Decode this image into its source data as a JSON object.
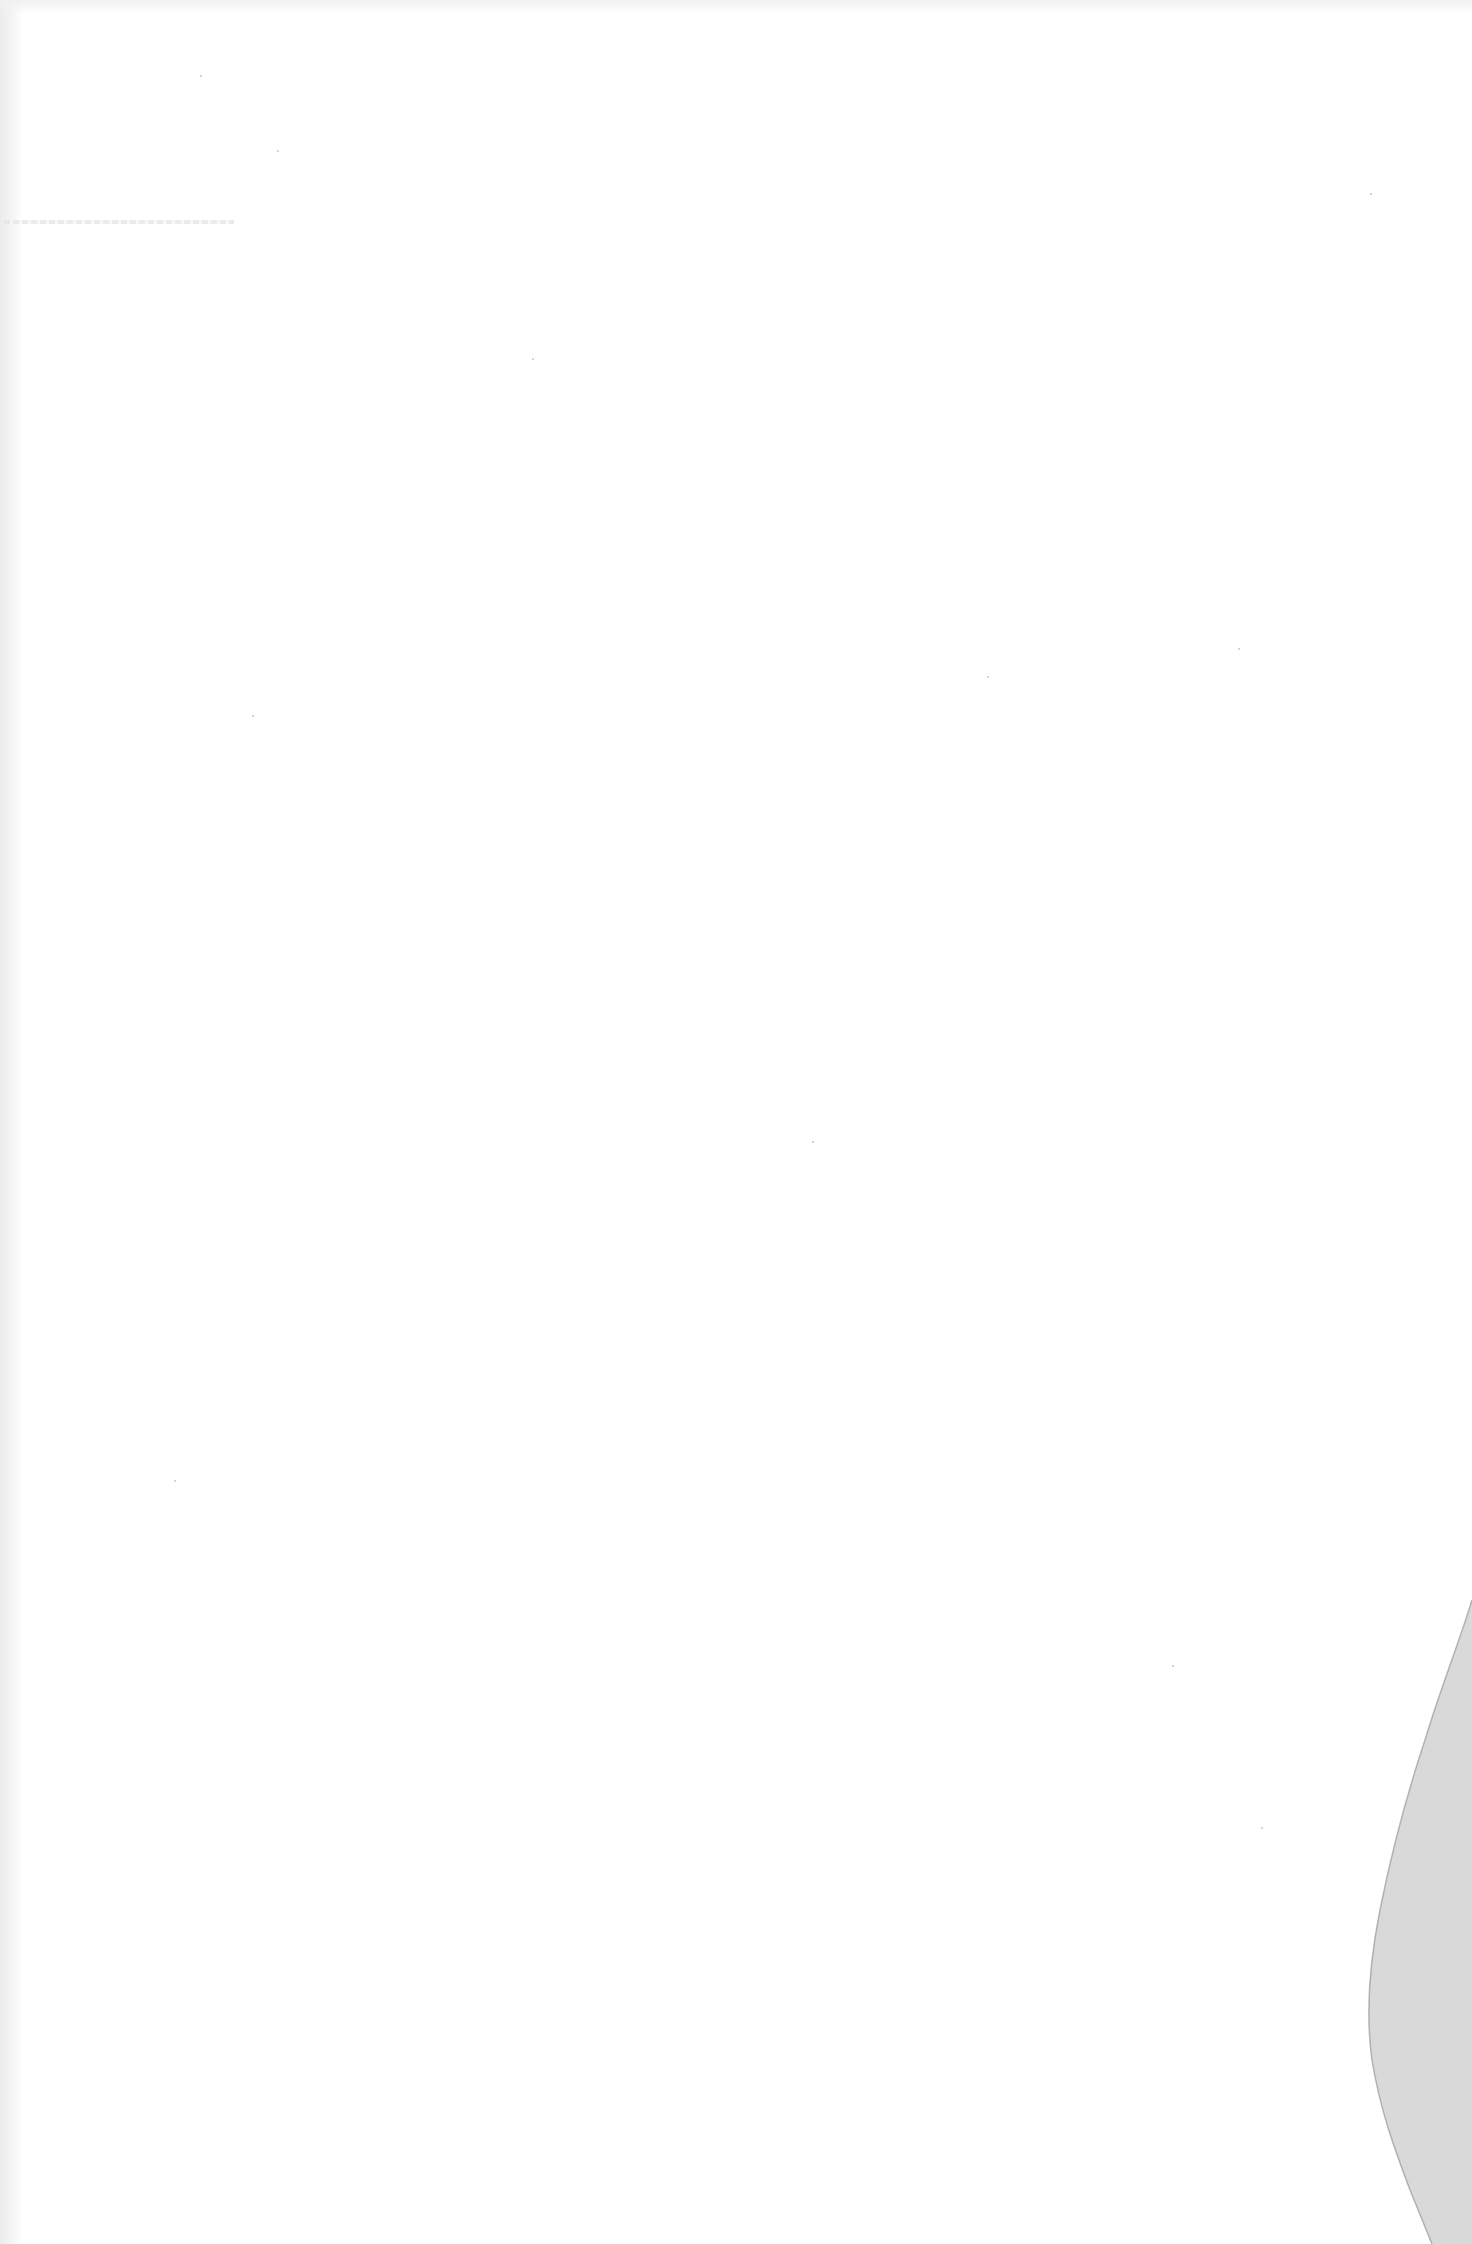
{
  "document": {
    "type": "scanned-page",
    "content": "",
    "state": "blank",
    "features": {
      "torn_corner": "bottom-right",
      "bleed_through": "faint, illegible marks near top-left"
    },
    "colors": {
      "paper": "#ffffff",
      "background": "#d9d9d9",
      "edge_shadow": "#ececec"
    }
  }
}
